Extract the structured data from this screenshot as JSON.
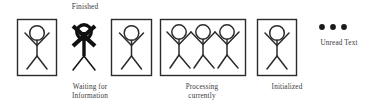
{
  "diagram": {
    "background_color": "#ffffff",
    "line_color": "#2b2b2b",
    "nodes": [
      {
        "id": "finished",
        "label": "Finished",
        "label_position": "above",
        "boxed": true,
        "figure_count": 1,
        "style": "normal",
        "box": {
          "x": 17,
          "y": 19,
          "w": 40,
          "h": 57
        }
      },
      {
        "id": "waiting",
        "label": "Waiting for\nInformation",
        "label_position": "below",
        "boxed": false,
        "figure_count": 1,
        "style": "bold-crossed",
        "box": {
          "x": 66,
          "y": 19,
          "w": 38,
          "h": 57
        }
      },
      {
        "id": "unlabeled-boxed",
        "label": "",
        "label_position": "none",
        "boxed": true,
        "figure_count": 1,
        "style": "normal",
        "box": {
          "x": 111,
          "y": 19,
          "w": 41,
          "h": 57
        }
      },
      {
        "id": "processing",
        "label": "Processing\ncurrently",
        "label_position": "below",
        "boxed": true,
        "figure_count": 3,
        "style": "normal",
        "box": {
          "x": 160,
          "y": 19,
          "w": 86,
          "h": 57
        }
      },
      {
        "id": "initialized",
        "label": "Initialized",
        "label_position": "below",
        "boxed": true,
        "figure_count": 1,
        "style": "normal",
        "box": {
          "x": 257,
          "y": 19,
          "w": 40,
          "h": 57
        }
      }
    ],
    "annotation": {
      "id": "unread",
      "label": "Unread Text",
      "marker": "three-dots",
      "dot_count": 3,
      "dot_color": "#1a1a1a",
      "dots": [
        {
          "cx": 322,
          "cy": 27,
          "r": 2.9
        },
        {
          "cx": 333,
          "cy": 27,
          "r": 2.9
        },
        {
          "cx": 344,
          "cy": 27,
          "r": 2.9
        }
      ]
    }
  }
}
